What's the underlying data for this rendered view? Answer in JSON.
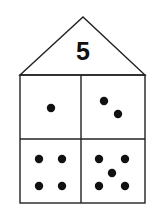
{
  "house": {
    "roof_number": "5",
    "line_color": "#222222",
    "dot_color": "#111111",
    "background": "#ffffff"
  },
  "geometry": {
    "apex": [
      83,
      17
    ],
    "left": 20,
    "right": 145,
    "roof_base": 75,
    "middle_y": 139,
    "bottom": 203,
    "middle_x": 81
  },
  "cells": [
    {
      "position": "top-left",
      "dot_count": 1,
      "dots": [
        [
          51,
          108
        ]
      ]
    },
    {
      "position": "top-right",
      "dot_count": 2,
      "dots": [
        [
          104,
          101
        ],
        [
          118,
          114
        ]
      ]
    },
    {
      "position": "bottom-left",
      "dot_count": 4,
      "dots": [
        [
          39,
          159
        ],
        [
          62,
          159
        ],
        [
          39,
          186
        ],
        [
          62,
          186
        ]
      ]
    },
    {
      "position": "bottom-right",
      "dot_count": 5,
      "dots": [
        [
          99,
          159
        ],
        [
          125,
          159
        ],
        [
          112,
          173
        ],
        [
          99,
          186
        ],
        [
          125,
          186
        ]
      ]
    }
  ]
}
